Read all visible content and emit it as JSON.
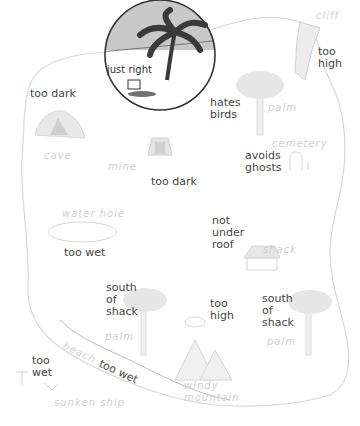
{
  "colors": {
    "outline": "#d8d8d8",
    "faint_fill": "#e6e6e6",
    "faint_text": "#cfcfcf",
    "label_text": "#444444",
    "highlight_circle": "#333333",
    "highlight_sky": "#c8c8c8",
    "palm_dark": "#3a3a3a"
  },
  "places": {
    "cliff": "cliff",
    "palm_ne": "palm",
    "cemetery": "cemetery",
    "cave": "cave",
    "mine": "mine",
    "water_hole": "water hole",
    "shack": "shack",
    "palm_sw": "palm",
    "palm_se": "palm",
    "beach": "beach",
    "windy_mountain_1": "windy",
    "windy_mountain_2": "mountain",
    "sunken_ship": "sunken ship"
  },
  "annotations": {
    "just_right": "just right",
    "cave": "too dark",
    "cliff": "too\nhigh",
    "palm_ne": "hates\nbirds",
    "cemetery": "avoids\nghosts",
    "mine": "too dark",
    "shack": "not\nunder\nroof",
    "water_hole": "too wet",
    "palm_sw": "south\nof\nshack",
    "mountain": "too\nhigh",
    "palm_se": "south\nof\nshack",
    "sunken_ship": "too\nwet",
    "beach": "too wet"
  }
}
